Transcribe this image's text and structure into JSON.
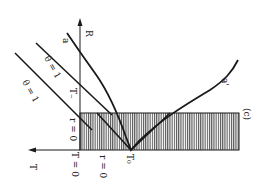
{
  "diagram": {
    "panel_label": "(c)",
    "axes": {
      "vertical_axis_label": "R",
      "horizontal_axis_label": "T"
    },
    "labels": {
      "a": "a",
      "a_prime": "a'",
      "theta_eq_1": "θ = 1",
      "theta_eq_0": "θ = 1",
      "r_eq_0_left": "r = 0",
      "r_eq_0_bottom": "r = 0",
      "T_eq_0": "T = 0",
      "T_minus": "T₋",
      "T0": "T₀"
    },
    "colors": {
      "line": "#1a1a1a",
      "hatch": "#555555",
      "background": "#ffffff"
    }
  }
}
